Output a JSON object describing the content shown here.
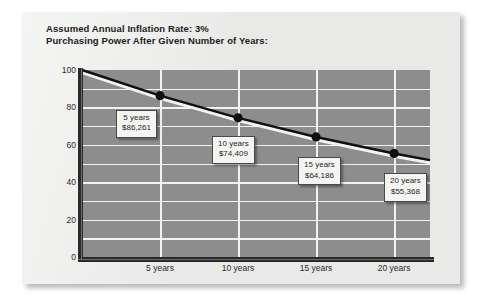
{
  "card": {
    "title_line1": "Assumed Annual Inflation Rate: 3%",
    "title_line2": "Purchasing Power After Given Number of Years:"
  },
  "chart_data": {
    "type": "line",
    "xlabel": "",
    "ylabel": "",
    "xlim": [
      0,
      22.3
    ],
    "ylim": [
      0,
      100
    ],
    "grid": true,
    "legend": "none",
    "y_ticks": [
      "100",
      "80",
      "60",
      "40",
      "20",
      "0"
    ],
    "y_tick_values": [
      100,
      80,
      60,
      40,
      20,
      0
    ],
    "y_gridline_values": [
      100,
      90,
      80,
      70,
      60,
      50,
      40,
      30,
      20,
      10,
      0
    ],
    "x_ticks": [
      "5 years",
      "10 years",
      "15 years",
      "20 years"
    ],
    "x_tick_values": [
      5,
      10,
      15,
      20
    ],
    "series": [
      {
        "name": "Purchasing Power",
        "x": [
          0,
          5,
          10,
          15,
          20,
          22.3
        ],
        "values": [
          100,
          86.261,
          74.409,
          64.186,
          55.368,
          51.8
        ]
      }
    ],
    "markers": [
      {
        "x": 5,
        "y": 86.261,
        "label_line1": "5 years",
        "label_line2": "$86,261"
      },
      {
        "x": 10,
        "y": 74.409,
        "label_line1": "10 years",
        "label_line2": "$74,409"
      },
      {
        "x": 15,
        "y": 64.186,
        "label_line1": "15 years",
        "label_line2": "$64,186"
      },
      {
        "x": 20,
        "y": 55.368,
        "label_line1": "20 years",
        "label_line2": "$55,368"
      }
    ],
    "colors": {
      "plot_background": "#8d8d8d",
      "card_background": "#e9e9e7",
      "gridline": "#f2f2f0",
      "axis": "#2a2a2a",
      "line": "#111111",
      "line_highlight": "#f2f2f0",
      "marker": "#101010",
      "callout_background": "#f4f4f2",
      "callout_border": "#4a4a4a",
      "text": "#1c1c1c"
    }
  }
}
